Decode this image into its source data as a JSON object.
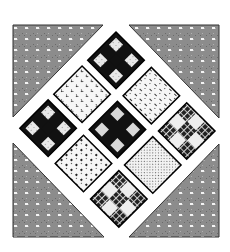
{
  "artwork": {
    "kind": "quilt block (on-point 3x3 blocks with corner setting triangles)",
    "colors": {
      "background": "#ffffff",
      "triangle_fill": "#8a8a8a",
      "triangle_dot": "#f2f2f2",
      "dark": "#111111",
      "light": "#f4f4f4",
      "mid": "#d8d8d8"
    },
    "corner_triangles": [
      {
        "name": "top-left",
        "pattern": "gray-dotted"
      },
      {
        "name": "top-right",
        "pattern": "gray-dotted"
      },
      {
        "name": "bottom-left",
        "pattern": "gray-dotted"
      },
      {
        "name": "bottom-right",
        "pattern": "gray-dotted"
      }
    ],
    "rows": [
      {
        "row": 1,
        "blocks": [
          "nine-patch-dark-light",
          "light-tiny-hearts",
          "nine-patch-dark-light"
        ]
      },
      {
        "row": 2,
        "blocks": [
          "light-dashes",
          "nine-patch-dark-gray",
          "light-dots"
        ]
      },
      {
        "row": 3,
        "blocks": [
          "nine-patch-woven",
          "light-fine-speckle",
          "nine-patch-woven"
        ]
      }
    ]
  }
}
